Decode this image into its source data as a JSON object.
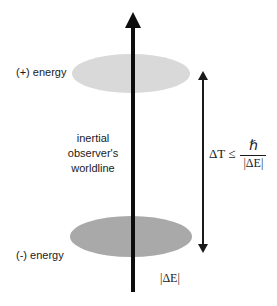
{
  "figure": {
    "background_color": "#ffffff"
  },
  "discs": {
    "positive": {
      "name": "positive-energy-level",
      "color": "#d9d9d9"
    },
    "negative": {
      "name": "negative-energy-level",
      "color": "#a9a9a9"
    }
  },
  "labels": {
    "positive_energy": "(+) energy",
    "negative_energy": "(-) energy",
    "worldline_line1": "inertial",
    "worldline_line2": "observer's",
    "worldline_line3": "worldline",
    "delta_e_bottom": "|ΔE|"
  },
  "formula": {
    "lhs": "ΔT ≤",
    "numerator": "ℏ",
    "denominator": "|ΔE|",
    "full": "ΔT ≤ ℏ / |ΔE|"
  },
  "arrows": {
    "worldline": {
      "name": "worldline-arrow",
      "direction": "up",
      "color": "#0d0d0d"
    },
    "interval": {
      "name": "time-interval-arrow",
      "direction": "double",
      "color": "#1a1a1a"
    }
  }
}
